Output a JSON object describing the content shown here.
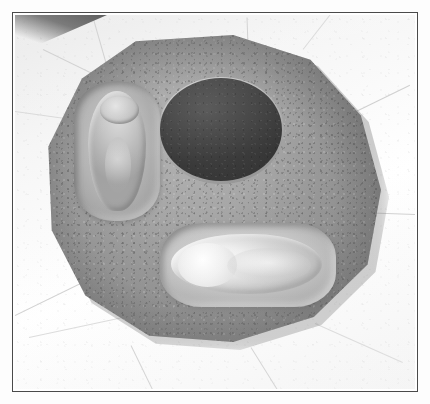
{
  "page": {
    "background_color": "#fdfdfd",
    "border_color": "#4a4a4a"
  },
  "photograph": {
    "caption": "",
    "alt": "Circular concrete monument slab set into pale stone paving, bearing a dark engraved disc and two recessed footprint impressions",
    "subject": "commemorative footprint monument",
    "orientation": "landscape",
    "colors": {
      "paving_stone": "#f2f2f2",
      "concrete_slab": "#9a9a9a",
      "engraved_disc": "#3d3d3d",
      "impression_highlight": "#ededed",
      "shadow": "#4e4e4e"
    },
    "elements": {
      "slab": {
        "name": "circular concrete monument slab",
        "shape": "dodecagon",
        "surface": "speckled aggregate concrete"
      },
      "disc": {
        "name": "engraved dark disc",
        "shape": "ellipse",
        "inscription_top": "",
        "inscription_signature": "",
        "legible": "false"
      },
      "impression_left": {
        "name": "upper-left recessed footprint impression",
        "orientation": "vertical"
      },
      "impression_bottom": {
        "name": "lower recessed footprint impression",
        "orientation": "horizontal"
      },
      "paving": {
        "name": "surrounding stone paving slabs",
        "pattern": "radiating joints"
      },
      "corner_shadow": {
        "name": "upper-left shadow wedge"
      }
    }
  }
}
